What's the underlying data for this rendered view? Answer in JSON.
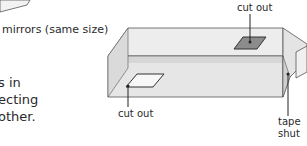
{
  "labels": {
    "mirrors": "mirrors (same size)",
    "cut_out_top": "cut out",
    "cut_out_bottom": "cut out",
    "tape_line1": "tape",
    "tape_line2": "shut"
  },
  "body_text": {
    "line1": "s in",
    "line2": "ecting",
    "line3": "other."
  },
  "colors": {
    "box_light": "#f2f2f2",
    "box_mid": "#e0e0e0",
    "box_dark": "#c8c8c8",
    "outline": "#555555",
    "cutout_dark": "#8a8a8a",
    "text": "#2a2a2a"
  }
}
